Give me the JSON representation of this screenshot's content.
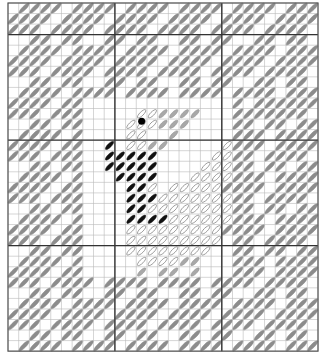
{
  "chart": {
    "origin_x": 8,
    "origin_y": 3,
    "cell_w": 10.69,
    "cell_h": 10.55,
    "cols": 29,
    "rows": 33,
    "major_cols": [
      10,
      20
    ],
    "major_rows": [
      3,
      13,
      23
    ],
    "colors": {
      "grid": "#b8b8b8",
      "major": "#333333",
      "border": "#555555",
      "gray_stitch": "#8c8c8c",
      "light_stitch": "#a8a8a8",
      "outline_stitch": "#8a8a8a",
      "black_stitch": "#111111"
    },
    "legend": {
      "G": "gray-stitch",
      "g": "light-gray-stitch",
      "o": "outline-stitch",
      "B": "black-stitch",
      ".": "empty"
    },
    "rows_data": [
      ".GGGG.GGGG.GGGG.GGGG.GGGG.GGG",
      "GGGG.GGGG.GGGG.GGGG.GGGG.GGGG",
      "GGG.GGGG.GGGG.GGGG.GGGG.GGGG.",
      "..GG.GG..GG.GG..GG.GG..GG.GG.",
      ".GGGG.GGGG.GGGG.GGGG.GGGG.GGG",
      "GGGG.GGGG.GGGG.GGGG.GGGG.GGGG",
      "GGG.GGGG.GGGG.GGGG.GGGG.GGGG.",
      "..GG.GG..GG.GG..GG.GG..GG.GG.",
      ".GGGG.GGGG.GGGG.GGGG.GGGG.GGG",
      "GGGG.GG..............G.GGGGGG",
      "GGG.GGG.....oogggg...GGGGGGG.",
      "..GG.GG....oooggg....GG.GG.GG",
      ".GGGG.G....oo..g.....GGG.GGGG",
      "GGGG.GG..B.oogg.....oGGG.GGGG",
      "GGG.GGG..BBBBB.....ooGG.GGGG.",
      "..GG.GG..BBBBB....oooGG.GG.GG",
      ".GGGG.G...BBBB...ooooGGG.GGGG",
      "GGGG.GG....BBo.oooooGGGG.GGGG",
      "GGG.GGG....BBBoooooooGG.GGGG.",
      "..GG.GG....BBooooooooGG.GG.GG",
      ".GGGG.G....BBBBooooooGGG.GGGG",
      "GGGG.GG....oooooooooGGGG.GGGG",
      "GGG.GGG....ooooooooo.GG.GGGG.",
      "..GG.GG....oooooooo..GG.GG.GG",
      ".GGGG.G.....oooogg...GGG.GGGG",
      "GGGG.GG.....g.gg.g...GGG.GGGG",
      "GGG.GGGG.GGGG.GGGG.GGGG.GGGG.",
      "..GG.GG..GG.GG..GG.GG..GG.GG.",
      ".GGGG.GGGG.GGGG.GGGG.GGGG.GGG",
      "GGGG.GGGG.GGGG.GGGG.GGGG.GGGG",
      "GGG.GGGG.GGGG.GGGG.GGGG.GGGG.",
      "..GG.GG..GG.GG..GG.GG..GG.GG.",
      ".GGGG.GGGG.GGGG.GGGG.GGGG.GGG"
    ],
    "dot": {
      "col": 12.5,
      "row": 11.2,
      "r": 3.5,
      "color": "#000000"
    }
  }
}
